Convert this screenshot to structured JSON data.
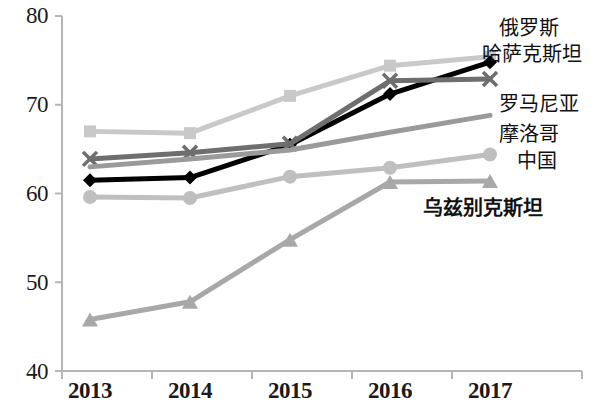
{
  "chart_data": {
    "type": "line",
    "title": "",
    "subtitle": "",
    "xlabel": "",
    "ylabel": "",
    "categories": [
      "2013",
      "2014",
      "2015",
      "2016",
      "2017"
    ],
    "x": [
      2013,
      2014,
      2015,
      2016,
      2017
    ],
    "ylim": [
      40,
      80
    ],
    "yticks": [
      40,
      50,
      60,
      70,
      80
    ],
    "ytick_labels": [
      "40",
      "50",
      "60",
      "70",
      "80"
    ],
    "grid": false,
    "legend_position": "right-inline-labels",
    "series": [
      {
        "name": "哈萨克斯坦",
        "name_en": "Kazakhstan",
        "marker": "square",
        "color": "#c9c9c9",
        "values": [
          67.0,
          66.8,
          71.0,
          74.4,
          75.4
        ]
      },
      {
        "name": "俄罗斯",
        "name_en": "Russia",
        "marker": "diamond",
        "color": "#000000",
        "values": [
          61.5,
          61.8,
          65.5,
          71.2,
          74.8
        ]
      },
      {
        "name": "罗马尼亚",
        "name_en": "Romania",
        "marker": "x",
        "color": "#6e6e6e",
        "values": [
          63.9,
          64.6,
          65.6,
          72.7,
          72.9
        ]
      },
      {
        "name": "摩洛哥",
        "name_en": "Morocco",
        "marker": "none",
        "color": "#9a9a9a",
        "values": [
          63.0,
          63.9,
          64.9,
          66.9,
          68.8
        ]
      },
      {
        "name": "中国",
        "name_en": "China",
        "marker": "circle",
        "color": "#bfbfbf",
        "values": [
          59.6,
          59.5,
          61.9,
          62.9,
          64.4
        ]
      },
      {
        "name": "乌兹别克斯坦",
        "name_en": "Uzbekistan",
        "marker": "triangle",
        "color": "#a8a8a8",
        "values": [
          45.8,
          47.8,
          54.8,
          61.3,
          61.4
        ]
      }
    ],
    "annotations": [
      {
        "text": "俄罗斯",
        "for_series": "俄罗斯"
      },
      {
        "text": "哈萨克斯坦",
        "for_series": "哈萨克斯坦"
      },
      {
        "text": "罗马尼亚",
        "for_series": "罗马尼亚"
      },
      {
        "text": "摩洛哥",
        "for_series": "摩洛哥"
      },
      {
        "text": "中国",
        "for_series": "中国"
      },
      {
        "text": "乌兹别克斯坦",
        "for_series": "乌兹别克斯坦"
      }
    ]
  },
  "axes": {
    "y_labels": [
      "80",
      "70",
      "60",
      "50",
      "40"
    ],
    "x_labels": [
      "2013",
      "2014",
      "2015",
      "2016",
      "2017"
    ],
    "axis_color": "#b5b5b5"
  },
  "labels": {
    "russia": "俄罗斯",
    "kazakhstan": "哈萨克斯坦",
    "romania": "罗马尼亚",
    "morocco": "摩洛哥",
    "china": "中国",
    "uzbekistan": "乌兹别克斯坦"
  }
}
